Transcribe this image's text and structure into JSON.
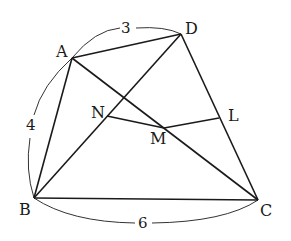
{
  "diagram": {
    "type": "geometry",
    "points": {
      "A": {
        "label": "A",
        "x": 72,
        "y": 58
      },
      "D": {
        "label": "D",
        "x": 181,
        "y": 34
      },
      "B": {
        "label": "B",
        "x": 34,
        "y": 198
      },
      "C": {
        "label": "C",
        "x": 258,
        "y": 200
      },
      "N": {
        "label": "N",
        "x": 107,
        "y": 116
      },
      "M": {
        "label": "M",
        "x": 164,
        "y": 128
      },
      "L": {
        "label": "L",
        "x": 219,
        "y": 118
      }
    },
    "segments": [
      [
        "A",
        "D"
      ],
      [
        "D",
        "C"
      ],
      [
        "C",
        "B"
      ],
      [
        "B",
        "A"
      ],
      [
        "A",
        "C"
      ],
      [
        "B",
        "D"
      ],
      [
        "N",
        "M"
      ],
      [
        "M",
        "L"
      ]
    ],
    "lengths": {
      "AD": "3",
      "AB": "4",
      "BC": "6"
    },
    "colors": {
      "line": "#1a1a1a",
      "arc": "#333333"
    }
  }
}
